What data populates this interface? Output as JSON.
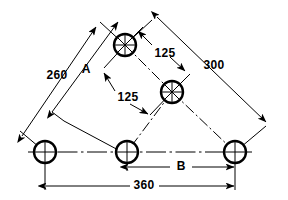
{
  "drawing": {
    "title": "Hole pattern dimensioned engineering drawing",
    "canvas": {
      "width": 288,
      "height": 200
    },
    "stroke_color": "#000000",
    "background_color": "#ffffff",
    "holes": [
      {
        "name": "hole-top",
        "cx": 125,
        "cy": 45,
        "r": 11
      },
      {
        "name": "hole-middle-right",
        "cx": 172,
        "cy": 92,
        "r": 11
      },
      {
        "name": "hole-bottom-left",
        "cx": 45,
        "cy": 152,
        "r": 11
      },
      {
        "name": "hole-bottom-mid",
        "cx": 127,
        "cy": 152,
        "r": 11
      },
      {
        "name": "hole-bottom-right",
        "cx": 235,
        "cy": 152,
        "r": 11
      }
    ],
    "dimensions": {
      "dim_260": {
        "value": "260",
        "x": 57,
        "y": 76
      },
      "dim_A": {
        "value": "A",
        "x": 86,
        "y": 70
      },
      "dim_125a": {
        "value": "125",
        "x": 165,
        "y": 54
      },
      "dim_125b": {
        "value": "125",
        "x": 128,
        "y": 98
      },
      "dim_300": {
        "value": "300",
        "x": 214,
        "y": 66
      },
      "dim_B": {
        "value": "B",
        "x": 181,
        "y": 167
      },
      "dim_360": {
        "value": "360",
        "x": 144,
        "y": 186
      }
    }
  }
}
